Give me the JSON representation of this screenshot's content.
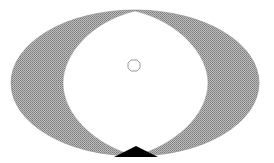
{
  "diagram": {
    "type": "geometric-figure",
    "colors": {
      "stipple_fill": "#a8a8a8",
      "stipple_dot": "#777777",
      "outline": "#555555",
      "triangle": "#000000",
      "background": "#ffffff"
    },
    "shapes": [
      {
        "name": "outer-ellipse",
        "cx": 135,
        "cy": 83,
        "rx": 124,
        "ry": 73
      },
      {
        "name": "inner-lens",
        "top": [
          135,
          11
        ],
        "bottom": [
          135,
          156
        ],
        "left_x": 63,
        "right_x": 208
      },
      {
        "name": "center-marker",
        "cx": 134,
        "cy": 65,
        "r": 5
      },
      {
        "name": "bottom-triangle",
        "points": [
          [
            114,
            156
          ],
          [
            135,
            146
          ],
          [
            157,
            156
          ]
        ]
      }
    ]
  }
}
